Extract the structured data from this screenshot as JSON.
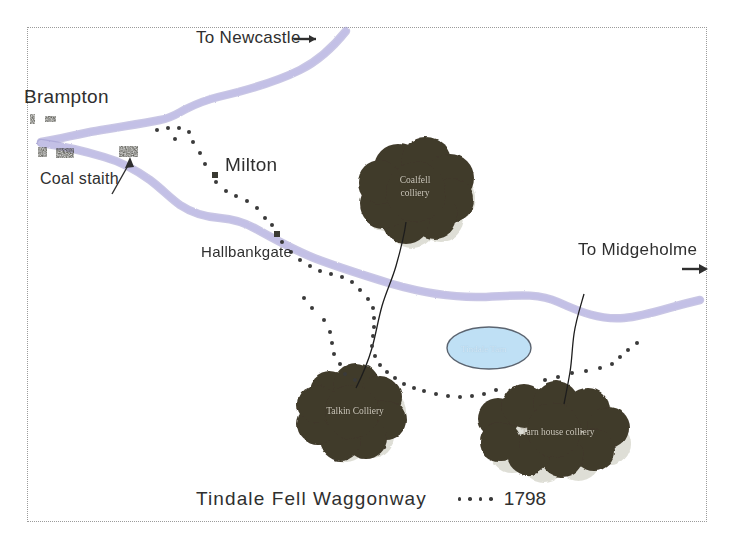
{
  "map": {
    "title": "Tindale Fell Waggonway",
    "year": "1798",
    "caption_full": "Tindale Fell Waggonway    • • • • 1798",
    "colors": {
      "road": "#b9b6e0",
      "road_edge": "#9d99cf",
      "colliery_fill": "#403a2a",
      "colliery_shadow": "#d9d9cf",
      "water_fill": "#bfe0f5",
      "water_edge": "#5b6470",
      "building": "#3a3a32",
      "tramway_dot": "#3a3a3a",
      "frame": "#9b9b9b",
      "text": "#2f2f2f",
      "colliery_text": "#cfcabc"
    },
    "directions": [
      {
        "id": "newcastle",
        "label": "To Newcastle",
        "arrow": "→",
        "x": 196,
        "y": 30
      },
      {
        "id": "midgeholme",
        "label": "To Midgeholme",
        "arrow": "→",
        "x": 578,
        "y": 241
      }
    ],
    "places": [
      {
        "id": "brampton",
        "label": "Brampton",
        "x": 24,
        "y": 88,
        "size": "big"
      },
      {
        "id": "milton",
        "label": "Milton",
        "x": 225,
        "y": 156,
        "size": "big"
      },
      {
        "id": "hallbankgate",
        "label": "Hallbankgate",
        "x": 201,
        "y": 244,
        "size": "small"
      },
      {
        "id": "coal-staith",
        "label": "Coal staith",
        "x": 40,
        "y": 172,
        "size": "small"
      }
    ],
    "collieries": [
      {
        "id": "coalfell",
        "line1": "Coalfell",
        "line2": "colliery",
        "cx": 414,
        "cy": 191
      },
      {
        "id": "talkin",
        "line1": "Talkin Colliery",
        "line2": "",
        "cx": 354,
        "cy": 411
      },
      {
        "id": "tarn-house",
        "line1": "Tarn house colliery",
        "line2": "",
        "cx": 557,
        "cy": 432
      }
    ],
    "water": [
      {
        "id": "tindale-tarn",
        "label": "Tindale Tarn",
        "cx": 489,
        "cy": 348,
        "rx": 42,
        "ry": 21
      }
    ],
    "legend": {
      "waggonway_label": "Tindale Fell Waggonway",
      "year_label": "1798",
      "dot_count": 4
    }
  }
}
